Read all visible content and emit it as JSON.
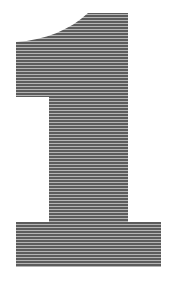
{
  "figure": {
    "glyph": "1",
    "colors": {
      "background": "#ffffff",
      "stripe_dark": "#5a5a5a",
      "stripe_light": "#b4b4b4"
    },
    "stripe_period_px": 3
  }
}
